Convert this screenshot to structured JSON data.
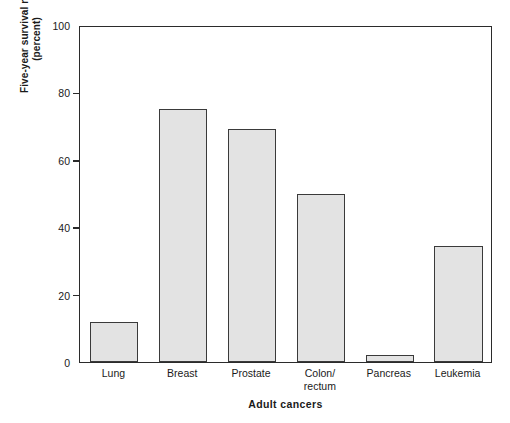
{
  "chart_data": {
    "type": "bar",
    "title": "",
    "categories": [
      "Lung",
      "Breast",
      "Prostate",
      "Colon/\nrectum",
      "Pancreas",
      "Leukemia"
    ],
    "values": [
      12,
      75,
      69,
      50,
      2,
      34.5
    ],
    "xlabel": "Adult cancers",
    "ylabel": "Five-year survival rate\n(percent)",
    "ylabel_line1": "Five-year survival rate",
    "ylabel_line2": "(percent)",
    "ylim": [
      0,
      100
    ],
    "yticks": [
      0,
      20,
      40,
      60,
      80,
      100
    ],
    "ytick_labels": [
      "0",
      "20",
      "40",
      "60",
      "80",
      "100"
    ],
    "grid": false,
    "legend": false,
    "bar_fill_color": "#e3e3e3",
    "bar_edge_color": "#3a3a3a",
    "axis_color": "#2b2b2b",
    "background_color": "#ffffff"
  },
  "axis": {
    "y_title_line1": "Five-year survival rate",
    "y_title_line2": "(percent)",
    "x_title": "Adult cancers"
  },
  "ticks": {
    "y": [
      {
        "label": "100",
        "value": 100
      },
      {
        "label": "80",
        "value": 80
      },
      {
        "label": "60",
        "value": 60
      },
      {
        "label": "40",
        "value": 40
      },
      {
        "label": "20",
        "value": 20
      },
      {
        "label": "0",
        "value": 0
      }
    ]
  },
  "bars": [
    {
      "label": "Lung",
      "value": 12
    },
    {
      "label": "Breast",
      "value": 75
    },
    {
      "label": "Prostate",
      "value": 69
    },
    {
      "label": "Colon/\nrectum",
      "value": 50
    },
    {
      "label": "Pancreas",
      "value": 2
    },
    {
      "label": "Leukemia",
      "value": 34.5
    }
  ]
}
